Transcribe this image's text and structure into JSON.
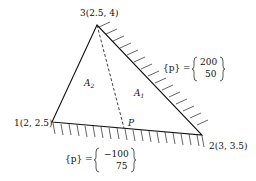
{
  "nodes": [
    {
      "id": "1",
      "label": "1(2, 2.5)",
      "x": 2,
      "y": 2.5
    },
    {
      "id": "2",
      "label": "2(3, 3.5)",
      "x": 3,
      "y": 3.5
    },
    {
      "id": "3",
      "label": "3(2.5, 4)",
      "x": 2.5,
      "y": 4
    }
  ],
  "areas": {
    "a1": {
      "main": "A",
      "sub": "1"
    },
    "a2": {
      "main": "A",
      "sub": "2"
    }
  },
  "point": {
    "label": "P"
  },
  "loads": {
    "edge_23": {
      "lhs": "{p} =",
      "values": [
        "200",
        "50"
      ]
    },
    "edge_12": {
      "lhs": "{p} =",
      "values": [
        "−100",
        "75"
      ]
    }
  }
}
